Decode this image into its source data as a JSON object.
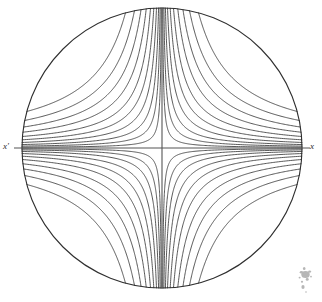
{
  "figure": {
    "background_color": "#ffffff",
    "line_color": "#3a3a3a",
    "axis_color": "#555555",
    "circle_color": "#2f2f2f",
    "smudge_color": "#9a9a9a",
    "width": 322,
    "height": 302
  },
  "labels": {
    "left_axis_label": "x'",
    "right_axis_label": "x"
  },
  "chart_data": {
    "type": "line",
    "xlabel": "x",
    "ylabel": "",
    "grid": false,
    "legend": "none",
    "xlim": [
      -1.15,
      1.15
    ],
    "ylim": [
      -1.15,
      1.15
    ],
    "annotations": [
      {
        "text": "x'",
        "x": -1.1,
        "y": 0.0,
        "anchor": "left-axis-end"
      },
      {
        "text": "x",
        "x": 1.1,
        "y": 0.0,
        "anchor": "right-axis-end"
      }
    ],
    "geometry": {
      "circle": {
        "cx": 162,
        "cy": 148,
        "r": 140,
        "unit": "px"
      },
      "horizontal_axis": {
        "x1": 14,
        "y1": 148,
        "x2": 310,
        "y2": 148,
        "unit": "px"
      },
      "vertical_axis": {
        "x1": 162,
        "y1": 8,
        "x2": 162,
        "y2": 288,
        "unit": "px"
      }
    },
    "curve_family": {
      "description": "Rectangular hyperbolas x*y = k asymptotic to both axes, clipped to the circle, repeated with mirror symmetry in all four quadrants.",
      "equation": "x * y = k",
      "curves_per_quadrant": 10,
      "quadrants": [
        "top-left",
        "top-right",
        "bottom-left",
        "bottom-right"
      ],
      "k_values": [
        0.0055,
        0.0135,
        0.0245,
        0.0395,
        0.0585,
        0.082,
        0.112,
        0.148,
        0.193,
        0.252
      ]
    },
    "series": [
      {
        "name": "hyperbola-1",
        "k": 0.0055
      },
      {
        "name": "hyperbola-2",
        "k": 0.0135
      },
      {
        "name": "hyperbola-3",
        "k": 0.0245
      },
      {
        "name": "hyperbola-4",
        "k": 0.0395
      },
      {
        "name": "hyperbola-5",
        "k": 0.0585
      },
      {
        "name": "hyperbola-6",
        "k": 0.082
      },
      {
        "name": "hyperbola-7",
        "k": 0.112
      },
      {
        "name": "hyperbola-8",
        "k": 0.148
      },
      {
        "name": "hyperbola-9",
        "k": 0.193
      },
      {
        "name": "hyperbola-10",
        "k": 0.252
      }
    ]
  }
}
